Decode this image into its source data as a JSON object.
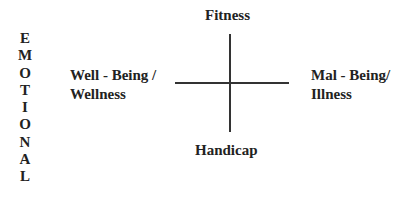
{
  "side_label": {
    "text": "EMOTIONAL",
    "letters": [
      "E",
      "M",
      "O",
      "T",
      "I",
      "O",
      "N",
      "A",
      "L"
    ]
  },
  "axes": {
    "top": "Fitness",
    "bottom": "Handicap",
    "left_line1": "Well - Being /",
    "left_line2": "Wellness",
    "right_line1": "Mal - Being/",
    "right_line2": "Illness"
  },
  "colors": {
    "line": "#333333",
    "text": "#222222",
    "background": "#ffffff"
  }
}
